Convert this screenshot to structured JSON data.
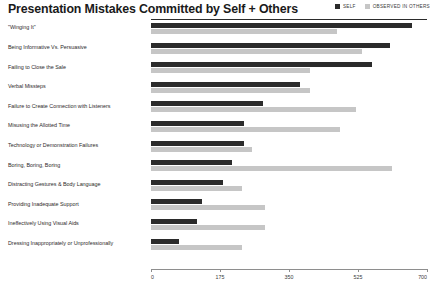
{
  "header": {
    "title": "Presentation Mistakes Committed by Self + Others"
  },
  "legend": {
    "position": "top-right",
    "entries": [
      {
        "label": "SELF",
        "color": "#2b2b2b",
        "icon": "square-swatch"
      },
      {
        "label": "OBSERVED IN OTHERS",
        "color": "#c6c6c6",
        "icon": "square-swatch"
      }
    ]
  },
  "axis": {
    "ticks": [
      "0",
      "175",
      "350",
      "525",
      "700"
    ],
    "min": 0,
    "max": 700
  },
  "chart_data": {
    "type": "bar",
    "orientation": "horizontal",
    "title": "Presentation Mistakes Committed by Self + Others",
    "xlabel": "",
    "ylabel": "",
    "xlim": [
      0,
      700
    ],
    "xticks": [
      0,
      175,
      350,
      525,
      700
    ],
    "grid": false,
    "legend_position": "top-right",
    "categories": [
      "\"Winging It\"",
      "Being Informative Vs. Persuasive",
      "Failing to Close the Sale",
      "Verbal Missteps",
      "Failure to Create Connection with Listeners",
      "Misusing the Allotted Time",
      "Technology or Demonstration Failures",
      "Boring, Boring, Boring",
      "Distracting Gestures & Body Language",
      "Providing Inadequate Support",
      "Ineffectively Using Visual Aids",
      "Dressing Inappropriately or Unprofessionally"
    ],
    "series": [
      {
        "name": "SELF",
        "color": "#2b2b2b",
        "values": [
          662,
          606,
          560,
          378,
          284,
          236,
          236,
          205,
          183,
          129,
          117,
          71
        ]
      },
      {
        "name": "OBSERVED IN OTHERS",
        "color": "#c6c6c6",
        "values": [
          472,
          535,
          403,
          403,
          520,
          479,
          256,
          611,
          231,
          289,
          289,
          231
        ]
      }
    ]
  }
}
